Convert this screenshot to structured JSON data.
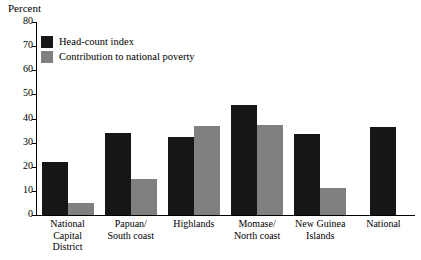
{
  "chart_data": {
    "type": "bar",
    "title": "",
    "ylabel": "Percent",
    "xlabel": "",
    "ylim": [
      0,
      80
    ],
    "yticks": [
      0,
      10,
      20,
      30,
      40,
      50,
      60,
      70,
      80
    ],
    "grid": false,
    "legend_position": "top-left",
    "categories": [
      "National\nCapital\nDistrict",
      "Papuan/\nSouth coast",
      "Highlands",
      "Momase/\nNorth coast",
      "New Guinea\nIslands",
      "National"
    ],
    "series": [
      {
        "name": "Head-count index",
        "color": "#161616",
        "values": [
          22,
          34,
          32.5,
          45.5,
          33.5,
          36.5
        ]
      },
      {
        "name": "Contribution to national poverty",
        "color": "#808080",
        "values": [
          5,
          15,
          37,
          37.5,
          11,
          null
        ]
      }
    ]
  },
  "legend": {
    "items": [
      {
        "label": "Head-count index",
        "swatch": "black-square-icon"
      },
      {
        "label": "Contribution to national poverty",
        "swatch": "gray-square-icon"
      }
    ]
  }
}
